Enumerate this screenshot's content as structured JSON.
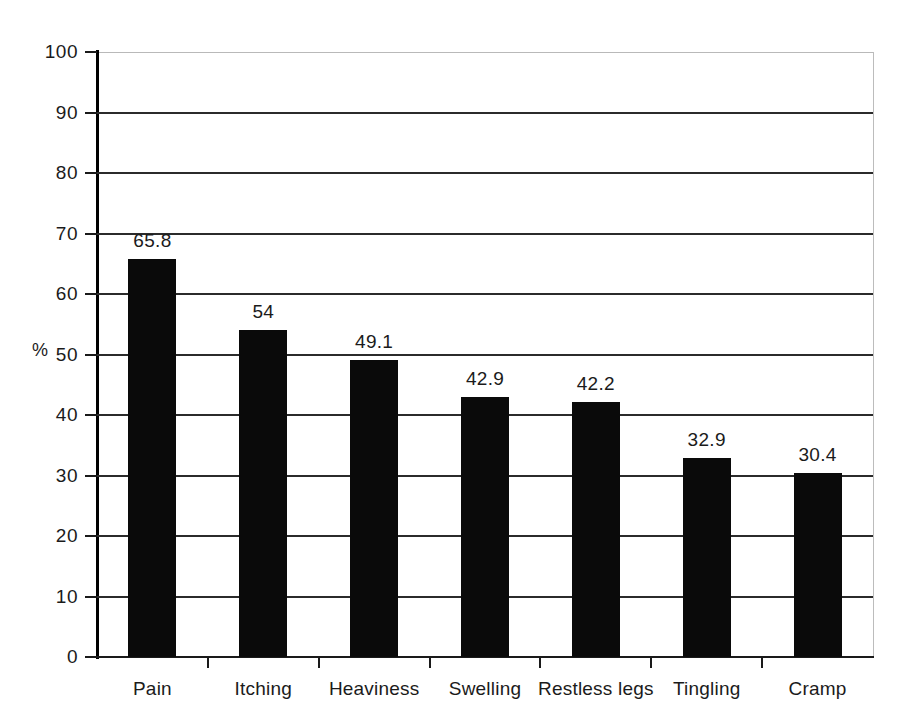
{
  "chart_data": {
    "type": "bar",
    "title": "",
    "subtitle": "",
    "xlabel": "",
    "ylabel": "%",
    "categories": [
      "Pain",
      "Itching",
      "Heaviness",
      "Swelling",
      "Restless legs",
      "Tingling",
      "Cramp"
    ],
    "values": [
      65.8,
      54,
      49.1,
      42.9,
      42.2,
      32.9,
      30.4
    ],
    "value_labels": [
      "65.8",
      "54",
      "49.1",
      "42.9",
      "42.2",
      "32.9",
      "30.4"
    ],
    "ylim": [
      0,
      100
    ],
    "ytick_values": [
      0,
      10,
      20,
      30,
      40,
      50,
      60,
      70,
      80,
      90,
      100
    ],
    "ytick_labels": [
      "0",
      "10",
      "20",
      "30",
      "40",
      "50",
      "60",
      "70",
      "80",
      "90",
      "100"
    ],
    "grid": "horizontal",
    "legend": "none",
    "bar_color": "#0a0a0a",
    "gridline_color": "#2b2b2b",
    "axis_color": "#1a1a1a",
    "frame_color": "#b9b9b9",
    "background_color": "#ffffff",
    "series": [
      {
        "name": "Symptom prevalence",
        "values": [
          65.8,
          54,
          49.1,
          42.9,
          42.2,
          32.9,
          30.4
        ]
      }
    ]
  }
}
